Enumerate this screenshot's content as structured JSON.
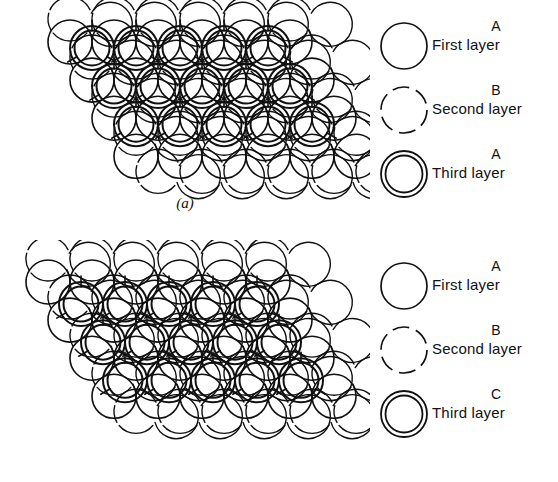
{
  "figure": {
    "background": "#ffffff",
    "ink_color": "#111111"
  },
  "panels": [
    {
      "id": "a",
      "caption": "(a)",
      "structure_name": "hexagonal close packed",
      "stacking": "ABA",
      "legend": {
        "items": [
          {
            "symbol": "solid-circle",
            "letter": "A",
            "label": "First layer"
          },
          {
            "symbol": "dashed-circle",
            "letter": "B",
            "label": "Second layer"
          },
          {
            "symbol": "double-circle",
            "letter": "A",
            "label": "Third layer"
          }
        ]
      }
    },
    {
      "id": "b",
      "caption": "(b)",
      "structure_name": "cubic close packed",
      "stacking": "ABC",
      "legend": {
        "items": [
          {
            "symbol": "solid-circle",
            "letter": "A",
            "label": "First layer"
          },
          {
            "symbol": "dashed-circle",
            "letter": "B",
            "label": "Second layer"
          },
          {
            "symbol": "double-circle",
            "letter": "C",
            "label": "Third layer"
          }
        ]
      }
    }
  ]
}
